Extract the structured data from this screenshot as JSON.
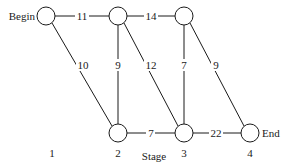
{
  "diagram": {
    "type": "stage network / shortest-path graph",
    "xlabel": "Stage",
    "stages": [
      {
        "label": "1",
        "x": 46
      },
      {
        "label": "2",
        "x": 118
      },
      {
        "label": "3",
        "x": 184
      },
      {
        "label": "4",
        "x": 250
      }
    ],
    "nodes": [
      {
        "id": "begin",
        "label": "Begin",
        "x": 46,
        "y": 16
      },
      {
        "id": "t2",
        "label": "",
        "x": 118,
        "y": 16
      },
      {
        "id": "t3",
        "label": "",
        "x": 184,
        "y": 16
      },
      {
        "id": "b2",
        "label": "",
        "x": 118,
        "y": 133
      },
      {
        "id": "b3",
        "label": "",
        "x": 184,
        "y": 133
      },
      {
        "id": "end",
        "label": "End",
        "x": 250,
        "y": 133
      }
    ],
    "edges": [
      {
        "from": "begin",
        "to": "t2",
        "weight": "11"
      },
      {
        "from": "begin",
        "to": "b2",
        "weight": "10"
      },
      {
        "from": "t2",
        "to": "t3",
        "weight": "14"
      },
      {
        "from": "t2",
        "to": "b2",
        "weight": "9"
      },
      {
        "from": "t2",
        "to": "b3",
        "weight": "12"
      },
      {
        "from": "t3",
        "to": "b3",
        "weight": "7"
      },
      {
        "from": "t3",
        "to": "end",
        "weight": "9"
      },
      {
        "from": "b2",
        "to": "b3",
        "weight": "7"
      },
      {
        "from": "b3",
        "to": "end",
        "weight": "22"
      }
    ],
    "colors": {
      "stroke": "#1a1a1a",
      "background": "#ffffff"
    }
  }
}
